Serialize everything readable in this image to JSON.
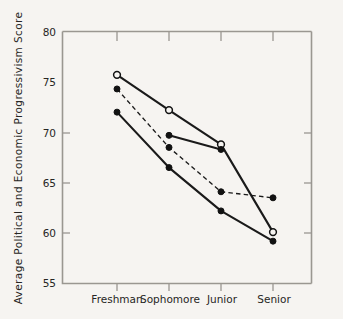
{
  "figure": {
    "background_color": "#f6f4f1",
    "ink_color": "#121212",
    "axis_color": "#9a9791"
  },
  "axes": {
    "y_title": "Average Political and Economic Progressivism Score",
    "x_title": "",
    "y_ticks": [
      "80",
      "75",
      "70",
      "65",
      "60",
      "55"
    ],
    "x_ticks": [
      "Freshman",
      "Sophomore",
      "Junior",
      "Senior"
    ]
  },
  "chart_data": {
    "type": "line",
    "title": "",
    "xlabel": "",
    "ylabel": "Average Political and Economic Progressivism Score",
    "categories": [
      "Freshman",
      "Sophomore",
      "Junior",
      "Senior"
    ],
    "ylim": [
      55,
      80
    ],
    "yticks": [
      55,
      60,
      65,
      70,
      75,
      80
    ],
    "grid": false,
    "legend": "none",
    "series": [
      {
        "name": "series-1-open-solid",
        "values": [
          75.7,
          72.2,
          68.8,
          60.1
        ],
        "linestyle": "solid",
        "marker": "open-circle",
        "color": "#121212"
      },
      {
        "name": "series-2-filled-dashed",
        "values": [
          74.3,
          68.5,
          64.1,
          63.5
        ],
        "linestyle": "dashed",
        "marker": "filled-circle",
        "color": "#121212"
      },
      {
        "name": "series-3-filled-solid",
        "values": [
          72.0,
          66.5,
          62.2,
          59.2
        ],
        "linestyle": "solid",
        "marker": "filled-circle",
        "color": "#121212"
      },
      {
        "name": "series-4-partial-filled-solid",
        "values": [
          null,
          69.7,
          68.3,
          null
        ],
        "linestyle": "solid",
        "marker": "filled-circle",
        "color": "#121212"
      }
    ]
  }
}
